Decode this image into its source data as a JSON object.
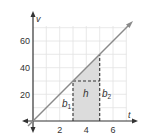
{
  "diagram": {
    "type": "velocity-time graph with trapezoid area",
    "axes": {
      "x": {
        "label": "t",
        "ticks": [
          "2",
          "4",
          "6"
        ],
        "range": [
          0,
          7
        ]
      },
      "y": {
        "label": "v",
        "ticks": [
          "20",
          "40",
          "60"
        ],
        "range": [
          0,
          70
        ]
      }
    },
    "line": {
      "from": [
        0,
        0
      ],
      "to": [
        7.4,
        74
      ],
      "equation": "v = 10t"
    },
    "trapezoid": {
      "t_start": 3,
      "t_end": 5,
      "v_start": 30,
      "v_end": 50,
      "fill": "#dcdcdc"
    },
    "labels": {
      "b1": {
        "base": "b",
        "sub": "1"
      },
      "b2": {
        "base": "b",
        "sub": "2"
      },
      "h": "h"
    },
    "colors": {
      "axis": "#333333",
      "grid": "#e2e2e2",
      "line": "#8a8a8a",
      "dashed": "#333333",
      "shade": "#dcdcdc"
    }
  }
}
